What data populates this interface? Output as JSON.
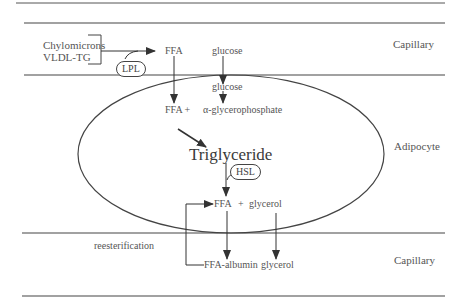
{
  "diagram": {
    "regions": {
      "top": "Capillary",
      "middle": "Adipocyte",
      "bottom": "Capillary"
    },
    "sources": {
      "line1": "Chylomicrons",
      "line2": "VLDL-TG"
    },
    "enzymes": {
      "lpl": "LPL",
      "hsl": "HSL"
    },
    "nodes": {
      "ffa_capillary": "FFA",
      "glucose_capillary": "glucose",
      "glucose_cell": "glucose",
      "ffa_plus": "FFA +",
      "alpha_gp": "α-glycerophosphate",
      "triglyceride": "Triglyceride",
      "ffa_glycerol_ffa": "FFA",
      "ffa_glycerol_plus": "+",
      "ffa_glycerol_glycerol": "glycerol",
      "reesterification": "reesterification",
      "ffa_albumin": "FFA-albumin",
      "glycerol_out": "glycerol"
    },
    "colors": {
      "line": "#444444",
      "text": "#555555",
      "background": "#ffffff"
    }
  }
}
